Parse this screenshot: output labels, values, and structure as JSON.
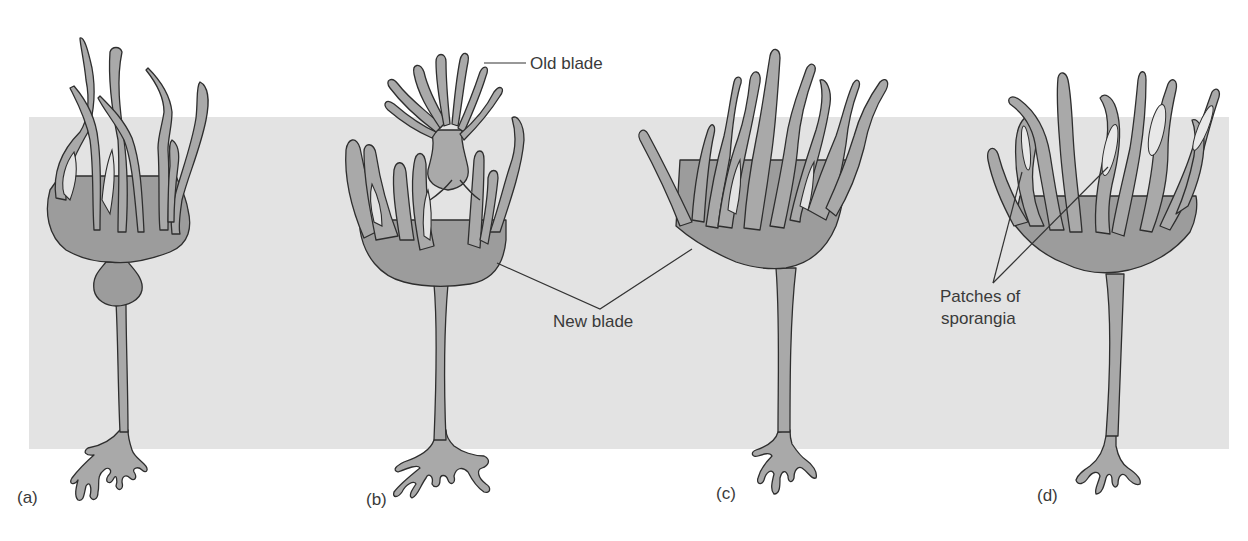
{
  "figure": {
    "panels": [
      {
        "id": "a",
        "label": "(a)"
      },
      {
        "id": "b",
        "label": "(b)"
      },
      {
        "id": "c",
        "label": "(c)"
      },
      {
        "id": "d",
        "label": "(d)"
      }
    ],
    "annotations": {
      "old_blade": "Old blade",
      "new_blade": "New blade",
      "sporangia_line1": "Patches of",
      "sporangia_line2": "sporangia"
    },
    "colors": {
      "background": "#ffffff",
      "water_band": "#e3e3e3",
      "tissue_fill": "#a9a9a9",
      "outline": "#2e2e2e"
    }
  }
}
